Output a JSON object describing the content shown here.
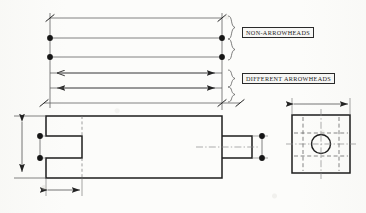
{
  "drawing": {
    "title": "Dimension line terminator styles",
    "background_color": "#fcfcfa",
    "line_color": "#2a2a2a",
    "annotations": [
      {
        "id": "non-arrowheads",
        "text": "NON-ARROWHEADS",
        "groups_rows": [
          1,
          2,
          3
        ]
      },
      {
        "id": "different-arrowheads",
        "text": "DIFFERENT ARROWHEADS",
        "groups_rows": [
          4,
          5,
          6
        ]
      }
    ],
    "dimension_rows": [
      {
        "row": 1,
        "y": 18,
        "x1": 50,
        "x2": 222,
        "left_terminator": "slash",
        "right_terminator": "slash"
      },
      {
        "row": 2,
        "y": 38,
        "x1": 50,
        "x2": 222,
        "left_terminator": "filled-dot",
        "right_terminator": "filled-dot"
      },
      {
        "row": 3,
        "y": 57,
        "x1": 50,
        "x2": 222,
        "left_terminator": "filled-dot",
        "right_terminator": "filled-dot"
      },
      {
        "row": 4,
        "y": 73,
        "x1": 50,
        "x2": 222,
        "left_terminator": "open-arrow",
        "right_terminator": "filled-arrow"
      },
      {
        "row": 5,
        "y": 88,
        "x1": 50,
        "x2": 222,
        "left_terminator": "filled-arrow",
        "right_terminator": "filled-arrow"
      },
      {
        "row": 6,
        "y": 103,
        "x1": 44,
        "x2": 222,
        "left_terminator": "slash",
        "right_terminator": "slash"
      }
    ],
    "front_view": {
      "name": "slotted-block-front-view",
      "body": {
        "x": 46,
        "y": 116,
        "width": 176,
        "height": 62
      },
      "slot": {
        "x": 46,
        "y": 136,
        "width": 36,
        "height": 22
      },
      "boss": {
        "x": 222,
        "y": 136,
        "width": 30,
        "height": 22
      },
      "dimensions": [
        {
          "id": "overall-height",
          "orientation": "vertical",
          "terminator": "filled-arrow"
        },
        {
          "id": "slot-height",
          "orientation": "vertical",
          "terminator": "filled-dot"
        },
        {
          "id": "boss-height",
          "orientation": "vertical",
          "terminator": "filled-dot"
        },
        {
          "id": "slot-depth",
          "orientation": "horizontal",
          "terminator": "filled-arrow"
        }
      ]
    },
    "side_view": {
      "name": "square-end-view",
      "square": {
        "x": 292,
        "y": 115,
        "width": 58,
        "height": 58
      },
      "hole": {
        "cx": 321,
        "cy": 144,
        "r": 9.5
      },
      "centerlines": [
        "horizontal",
        "vertical"
      ],
      "hidden_lines": [
        "slot-upper",
        "slot-lower"
      ],
      "dimensions": [
        {
          "id": "overall-width",
          "orientation": "horizontal",
          "terminator": "filled-arrow"
        }
      ]
    }
  }
}
